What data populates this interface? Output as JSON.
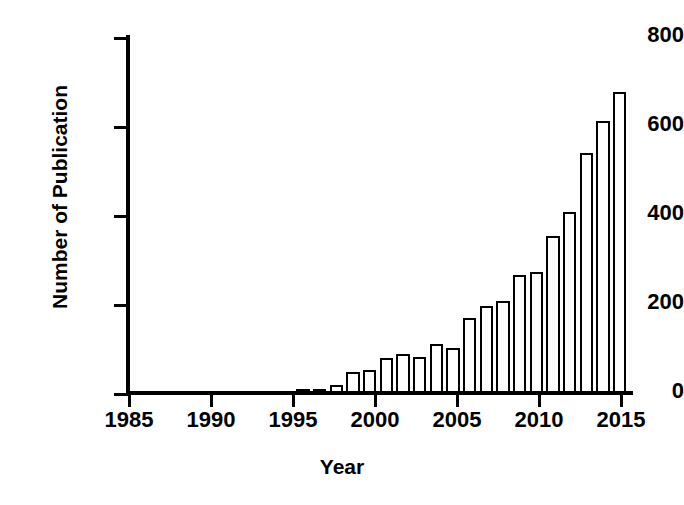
{
  "chart_data": {
    "type": "bar",
    "title": "",
    "xlabel": "Year",
    "ylabel": "Number of Publication",
    "xlim": [
      1985,
      2015
    ],
    "ylim": [
      0,
      800
    ],
    "yticks": [
      0,
      200,
      400,
      600,
      800
    ],
    "xticks": [
      1985,
      1990,
      1995,
      2000,
      2005,
      2010,
      2015
    ],
    "grid": false,
    "legend": null,
    "categories": [
      "1995",
      "1996",
      "1997",
      "1998",
      "1999",
      "2000",
      "2001",
      "2002",
      "2003",
      "2004",
      "2005",
      "2006",
      "2007",
      "2008",
      "2009",
      "2010",
      "2011",
      "2012",
      "2013",
      "2014"
    ],
    "values": [
      3,
      6,
      18,
      48,
      52,
      78,
      88,
      80,
      110,
      102,
      168,
      196,
      206,
      266,
      272,
      352,
      407,
      540,
      612,
      676
    ],
    "bar_style": {
      "fill": "#ffffff",
      "edge": "#000000",
      "edge_width_px": 2.5
    }
  },
  "axis": {
    "y_tick_labels": [
      "800",
      "600",
      "400",
      "200",
      "0"
    ],
    "x_tick_labels": [
      "1985",
      "1990",
      "1995",
      "2000",
      "2005",
      "2010",
      "2015"
    ],
    "y_title": "Number of Publication",
    "x_title": "Year"
  }
}
